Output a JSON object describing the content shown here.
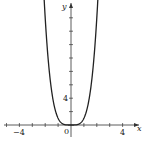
{
  "chart_data": {
    "type": "line",
    "title": "",
    "function": "y = x^4",
    "xlabel": "x",
    "ylabel": "y",
    "xlim": [
      -4.8,
      5.2
    ],
    "ylim": [
      -1.5,
      18.5
    ],
    "x_tick_step": 1,
    "y_tick_step": 2,
    "x_tick_labels": [
      {
        "value": -4,
        "label": "−4"
      },
      {
        "value": 0,
        "label": "0"
      },
      {
        "value": 4,
        "label": "4"
      }
    ],
    "y_tick_labels": [
      {
        "value": 4,
        "label": "4"
      }
    ],
    "series": [
      {
        "name": "y = x^4",
        "x": [
          -2.2,
          -2,
          -1.75,
          -1.5,
          -1.25,
          -1,
          -0.75,
          -0.5,
          -0.25,
          0,
          0.25,
          0.5,
          0.75,
          1,
          1.25,
          1.5,
          1.75,
          2,
          2.2
        ],
        "y": [
          23.43,
          16,
          9.38,
          5.06,
          2.44,
          1,
          0.32,
          0.06,
          0.004,
          0,
          0.004,
          0.06,
          0.32,
          1,
          2.44,
          5.06,
          9.38,
          16,
          23.43
        ]
      }
    ],
    "grid": false,
    "legend": "none",
    "colors": {
      "curve": "#222222",
      "axis": "#333333"
    }
  }
}
